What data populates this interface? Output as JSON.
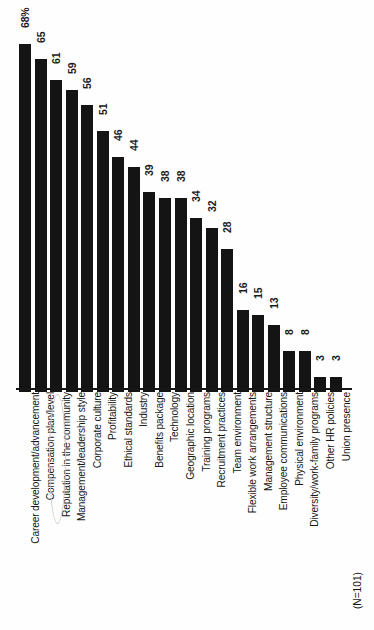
{
  "chart_data": {
    "type": "bar",
    "title": "",
    "subtitle": "",
    "xlabel": "",
    "ylabel": "",
    "grid": false,
    "legend": "none",
    "orientation": "vertical",
    "ylim": [
      0,
      68
    ],
    "note": "(N=101)",
    "highlighted_category": "Reputation in the community",
    "bar_color": "#141414",
    "categories": [
      "Career development/advancement",
      "Compensation plan/level",
      "Reputation in the community",
      "Management/leadership style",
      "Corporate culture",
      "Profitability",
      "Ethical standards",
      "Industry",
      "Benefits package",
      "Technology",
      "Geographic location",
      "Training programs",
      "Recruitment practices",
      "Team environment",
      "Flexible work arrangements",
      "Management structure",
      "Employee communications",
      "Physical environment",
      "Diversity/work-family programs",
      "Other HR policies",
      "Union presence"
    ],
    "values": [
      68,
      65,
      61,
      59,
      56,
      51,
      46,
      44,
      39,
      38,
      38,
      34,
      32,
      28,
      16,
      15,
      13,
      8,
      8,
      3,
      3
    ],
    "value_labels": [
      "68%",
      "65",
      "61",
      "59",
      "56",
      "51",
      "46",
      "44",
      "39",
      "38",
      "38",
      "34",
      "32",
      "28",
      "16",
      "15",
      "13",
      "8",
      "8",
      "3",
      "3"
    ]
  }
}
